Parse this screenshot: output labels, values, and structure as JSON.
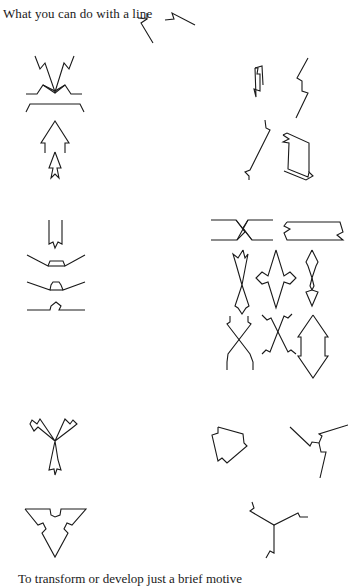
{
  "page": {
    "title": "What you can do with a line",
    "footer": "To transform or develop just a brief motive"
  },
  "figures": {
    "motive": {
      "label": "original-motive",
      "count": 2
    },
    "left_column": [
      {
        "group": "mirror-and-arrow-forms",
        "shapes": [
          "v-notch",
          "chevron-bar",
          "bracket-bar",
          "large-arrow",
          "small-arrow"
        ]
      },
      {
        "group": "bar-forms",
        "shapes": [
          "notched-tube",
          "wide-trough",
          "bump-trough",
          "bump-line"
        ]
      },
      {
        "group": "rotational-forms",
        "shapes": [
          "three-arm-star",
          "notched-triangle"
        ]
      }
    ],
    "right_column": [
      {
        "group": "zigzag-forms",
        "shapes": [
          "small-notched-bar",
          "lightning-zigzag",
          "long-diagonal",
          "parallelogram"
        ]
      },
      {
        "group": "symmetric-forms",
        "shapes": [
          "crossed-bands",
          "notched-rectangle",
          "hourglass-arrows",
          "four-point-diamond",
          "double-arrow",
          "crossed-x-1",
          "crossed-x-2",
          "double-headed-arrow"
        ]
      },
      {
        "group": "rotational-forms",
        "shapes": [
          "pentagon",
          "three-arm-zigzag",
          "three-arm-spiral"
        ]
      }
    ]
  }
}
